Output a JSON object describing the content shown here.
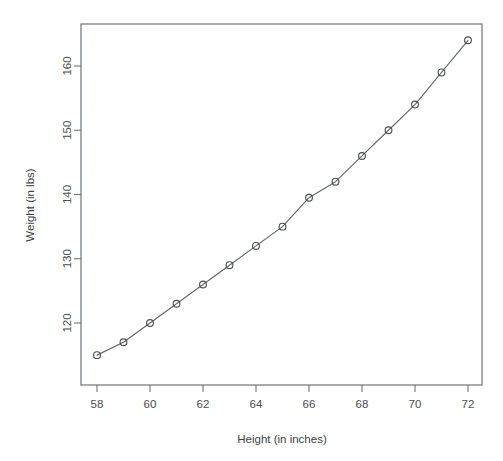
{
  "chart_data": {
    "type": "line",
    "title": "",
    "subtitle": "",
    "xlabel": "Height (in inches)",
    "ylabel": "Weight (in lbs)",
    "xlim": [
      57.4,
      72.6
    ],
    "ylim": [
      113.5,
      165.5
    ],
    "xticks": [
      58,
      60,
      62,
      64,
      66,
      68,
      70,
      72
    ],
    "xtick_labels": [
      "58",
      "60",
      "62",
      "64",
      "66",
      "68",
      "70",
      "72"
    ],
    "yticks": [
      120,
      130,
      140,
      150,
      160
    ],
    "ytick_labels": [
      "120",
      "130",
      "140",
      "150",
      "160"
    ],
    "grid": false,
    "legend": null,
    "marker": "open-circle",
    "line_color": "#63676b",
    "marker_color": "#4c5054",
    "axis_color": "#6e7276",
    "background": "#ffffff",
    "x": [
      58,
      59,
      60,
      61,
      62,
      63,
      64,
      65,
      66,
      67,
      68,
      69,
      70,
      71,
      72
    ],
    "y": [
      115,
      117,
      120,
      123,
      126,
      129,
      132,
      135,
      139.5,
      142,
      146,
      150,
      154,
      159,
      164
    ],
    "series": [
      {
        "name": "Height vs Weight",
        "x": [
          58,
          59,
          60,
          61,
          62,
          63,
          64,
          65,
          66,
          67,
          68,
          69,
          70,
          71,
          72
        ],
        "values": [
          115,
          117,
          120,
          123,
          126,
          129,
          132,
          135,
          139.5,
          142,
          146,
          150,
          154,
          159,
          164
        ]
      }
    ]
  },
  "figure": {
    "width": 503,
    "height": 461,
    "plot_left": 81,
    "plot_right": 482,
    "plot_top": 24,
    "plot_bottom": 385
  }
}
